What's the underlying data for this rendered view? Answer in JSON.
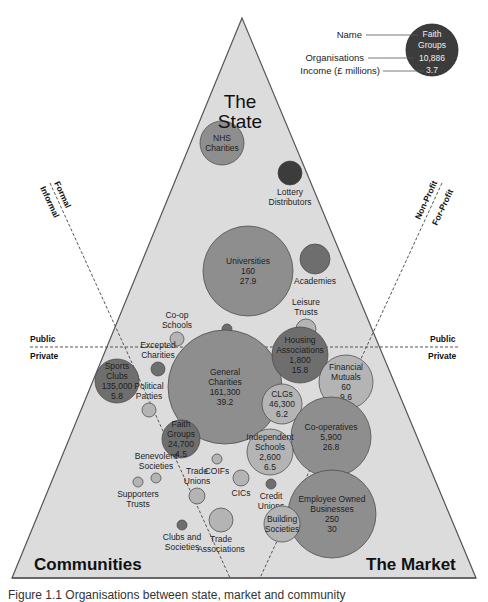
{
  "diagram": {
    "type": "triangle-bubble-diagram",
    "corners": {
      "top": [
        "The",
        "State"
      ],
      "bottom_left": "Communities",
      "bottom_right": "The Market"
    },
    "dividers": {
      "horizontal_above": "Public",
      "horizontal_below": "Private",
      "left_line_outer": "Formal",
      "left_line_inner": "Informal",
      "right_line_outer": "Non-Profit",
      "right_line_inner": "For-Profit"
    },
    "legend": {
      "name_label": "Name",
      "organisations_label": "Organisations",
      "income_label": "Income (£ millions)",
      "example_name": [
        "Faith",
        "Groups"
      ],
      "example_organisations": "10,886",
      "example_income": "3.7"
    },
    "colors": {
      "triangle_fill": "#dcdcdc",
      "triangle_stroke": "#555555",
      "dark": "#3c3c3c",
      "medium_dark": "#6e6e6e",
      "medium": "#8e8e8e",
      "light": "#b4b4b4"
    },
    "bubbles": [
      {
        "name": [
          "NHS",
          "Charities"
        ],
        "organisations": "",
        "income": "",
        "x": 222,
        "y": 143,
        "r": 22,
        "shade": "medium"
      },
      {
        "name": [
          "Lottery",
          "Distributors"
        ],
        "organisations": "",
        "income": "",
        "x": 290,
        "y": 173,
        "r": 12,
        "shade": "dark",
        "label_below": true
      },
      {
        "name": [
          "Universities"
        ],
        "organisations": "160",
        "income": "27.9",
        "x": 248,
        "y": 271,
        "r": 45,
        "shade": "medium"
      },
      {
        "name": [
          "Academies"
        ],
        "organisations": "",
        "income": "",
        "x": 315,
        "y": 259,
        "r": 15,
        "shade": "medium_dark",
        "label_below": true
      },
      {
        "name": [
          "Leisure",
          "Trusts"
        ],
        "organisations": "",
        "income": "",
        "x": 306,
        "y": 329,
        "r": 10,
        "shade": "light",
        "label_above": true
      },
      {
        "name": [
          "Co-op",
          "Schools"
        ],
        "organisations": "",
        "income": "",
        "x": 177,
        "y": 339,
        "r": 7,
        "shade": "light",
        "label_above": true
      },
      {
        "name": [
          "GP Mutuals"
        ],
        "organisations": "",
        "income": "",
        "x": 227,
        "y": 329,
        "r": 5,
        "shade": "medium_dark",
        "label_below": true
      },
      {
        "name": [
          "Excepted",
          "Charities"
        ],
        "organisations": "",
        "income": "",
        "x": 158,
        "y": 369,
        "r": 7,
        "shade": "medium_dark",
        "label_above": true
      },
      {
        "name": [
          "General",
          "Charities"
        ],
        "organisations": "161,300",
        "income": "39.2",
        "x": 225,
        "y": 387,
        "r": 57,
        "shade": "medium"
      },
      {
        "name": [
          "Sports",
          "Clubs"
        ],
        "organisations": "135,000",
        "income": "5.8",
        "x": 117,
        "y": 381,
        "r": 22,
        "shade": "medium_dark"
      },
      {
        "name": [
          "Political",
          "Parties"
        ],
        "organisations": "",
        "income": "",
        "x": 149,
        "y": 410,
        "r": 7,
        "shade": "light",
        "label_above": true
      },
      {
        "name": [
          "Faith",
          "Groups"
        ],
        "organisations": "24,700",
        "income": "4.5",
        "x": 181,
        "y": 439,
        "r": 19,
        "shade": "medium_dark"
      },
      {
        "name": [
          "Housing",
          "Associations"
        ],
        "organisations": "1,800",
        "income": "15.8",
        "x": 300,
        "y": 355,
        "r": 28,
        "shade": "medium_dark"
      },
      {
        "name": [
          "Financial",
          "Mutuals"
        ],
        "organisations": "60",
        "income": "9.6",
        "x": 346,
        "y": 382,
        "r": 27,
        "shade": "light"
      },
      {
        "name": [
          "CLGs"
        ],
        "organisations": "46,300",
        "income": "6.2",
        "x": 282,
        "y": 404,
        "r": 20,
        "shade": "light"
      },
      {
        "name": [
          "Co-operatives"
        ],
        "organisations": "5,900",
        "income": "26.8",
        "x": 331,
        "y": 437,
        "r": 40,
        "shade": "medium"
      },
      {
        "name": [
          "Independent",
          "Schools"
        ],
        "organisations": "2,600",
        "income": "6.5",
        "x": 270,
        "y": 452,
        "r": 23,
        "shade": "light"
      },
      {
        "name": [
          "Employee Owned",
          "Businesses"
        ],
        "organisations": "250",
        "income": "30",
        "x": 332,
        "y": 514,
        "r": 44,
        "shade": "medium"
      },
      {
        "name": [
          "Benevolent",
          "Societies"
        ],
        "organisations": "",
        "income": "",
        "x": 156,
        "y": 478,
        "r": 5,
        "shade": "light",
        "label_above": true
      },
      {
        "name": [
          "Supporters",
          "Trusts"
        ],
        "organisations": "",
        "income": "",
        "x": 138,
        "y": 482,
        "r": 5,
        "shade": "light",
        "label_below": true
      },
      {
        "name": [
          "COIFs"
        ],
        "organisations": "",
        "income": "",
        "x": 217,
        "y": 459,
        "r": 5,
        "shade": "light",
        "label_below": true
      },
      {
        "name": [
          "Trade",
          "Unions"
        ],
        "organisations": "",
        "income": "",
        "x": 197,
        "y": 496,
        "r": 8,
        "shade": "light",
        "label_above": true
      },
      {
        "name": [
          "CICs"
        ],
        "organisations": "",
        "income": "",
        "x": 241,
        "y": 478,
        "r": 8,
        "shade": "light",
        "label_below": true
      },
      {
        "name": [
          "Credit",
          "Unions"
        ],
        "organisations": "",
        "income": "",
        "x": 271,
        "y": 484,
        "r": 5,
        "shade": "medium_dark",
        "label_below": true
      },
      {
        "name": [
          "Building",
          "Societies"
        ],
        "organisations": "",
        "income": "",
        "x": 282,
        "y": 524,
        "r": 18,
        "shade": "light"
      },
      {
        "name": [
          "Trade",
          "Associations"
        ],
        "organisations": "",
        "income": "",
        "x": 221,
        "y": 520,
        "r": 12,
        "shade": "light",
        "label_below": true
      },
      {
        "name": [
          "Clubs and",
          "Societies"
        ],
        "organisations": "",
        "income": "",
        "x": 182,
        "y": 525,
        "r": 5,
        "shade": "medium_dark",
        "label_below": true
      }
    ]
  },
  "caption": "Figure 1.1 Organisations between state, market and community"
}
